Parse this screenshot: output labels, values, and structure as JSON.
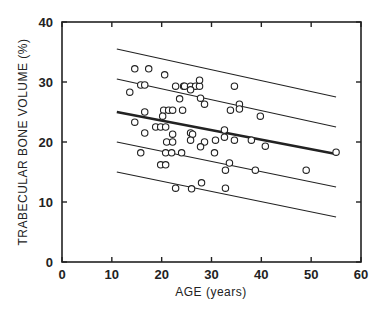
{
  "chart_data": {
    "type": "scatter",
    "title": "",
    "xlabel": "AGE (years)",
    "ylabel": "TRABECULAR BONE VOLUME (%)",
    "xlim": [
      0,
      60
    ],
    "ylim": [
      0,
      40
    ],
    "xticks": [
      0,
      10,
      20,
      30,
      40,
      50,
      60
    ],
    "yticks": [
      0,
      10,
      20,
      30,
      40
    ],
    "grid": false,
    "legend": null,
    "series": [
      {
        "name": "observations",
        "marker": "open-circle",
        "points": [
          [
            13.6,
            28.3
          ],
          [
            14.6,
            32.2
          ],
          [
            17.4,
            32.2
          ],
          [
            20.6,
            31.2
          ],
          [
            15.8,
            29.5
          ],
          [
            16.6,
            29.5
          ],
          [
            22.8,
            29.3
          ],
          [
            24.4,
            29.3
          ],
          [
            24.6,
            29.3
          ],
          [
            25.8,
            29.3
          ],
          [
            26.8,
            29.3
          ],
          [
            27.6,
            29.3
          ],
          [
            27.6,
            30.3
          ],
          [
            34.6,
            29.3
          ],
          [
            23.6,
            27.2
          ],
          [
            25.8,
            28.7
          ],
          [
            27.8,
            27.3
          ],
          [
            28.6,
            26.3
          ],
          [
            33.8,
            25.3
          ],
          [
            35.6,
            26.3
          ],
          [
            35.6,
            25.5
          ],
          [
            16.6,
            25.0
          ],
          [
            20.4,
            25.3
          ],
          [
            21.4,
            25.3
          ],
          [
            22.2,
            25.3
          ],
          [
            24.2,
            25.3
          ],
          [
            20.2,
            24.3
          ],
          [
            14.6,
            23.3
          ],
          [
            18.8,
            22.5
          ],
          [
            19.8,
            22.5
          ],
          [
            20.8,
            22.5
          ],
          [
            16.6,
            21.5
          ],
          [
            22.2,
            21.3
          ],
          [
            21.0,
            20.0
          ],
          [
            22.2,
            20.0
          ],
          [
            25.8,
            21.5
          ],
          [
            26.2,
            21.3
          ],
          [
            25.8,
            20.3
          ],
          [
            28.6,
            20.0
          ],
          [
            27.8,
            19.2
          ],
          [
            30.8,
            20.3
          ],
          [
            32.6,
            22.0
          ],
          [
            32.6,
            20.8
          ],
          [
            34.6,
            20.3
          ],
          [
            39.8,
            24.3
          ],
          [
            38.0,
            20.3
          ],
          [
            40.8,
            19.3
          ],
          [
            30.6,
            18.2
          ],
          [
            15.8,
            18.2
          ],
          [
            20.8,
            18.2
          ],
          [
            22.0,
            18.2
          ],
          [
            24.0,
            18.2
          ],
          [
            19.8,
            16.2
          ],
          [
            20.8,
            16.2
          ],
          [
            33.6,
            16.5
          ],
          [
            32.8,
            15.3
          ],
          [
            38.8,
            15.3
          ],
          [
            49.0,
            15.3
          ],
          [
            55.0,
            18.3
          ],
          [
            22.8,
            12.3
          ],
          [
            26.0,
            12.2
          ],
          [
            28.0,
            13.2
          ],
          [
            32.8,
            12.3
          ]
        ]
      }
    ],
    "lines": [
      {
        "name": "upper-outer-band",
        "x": [
          11,
          55
        ],
        "y": [
          35.5,
          27.5
        ],
        "weight": "thin"
      },
      {
        "name": "upper-inner-band",
        "x": [
          11,
          55
        ],
        "y": [
          30.5,
          22.5
        ],
        "weight": "thin"
      },
      {
        "name": "regression-line",
        "x": [
          11,
          55
        ],
        "y": [
          25.0,
          18.0
        ],
        "weight": "bold"
      },
      {
        "name": "lower-inner-band",
        "x": [
          11,
          55
        ],
        "y": [
          20.0,
          12.5
        ],
        "weight": "thin"
      },
      {
        "name": "lower-outer-band",
        "x": [
          11,
          55
        ],
        "y": [
          15.0,
          7.5
        ],
        "weight": "thin"
      }
    ]
  }
}
